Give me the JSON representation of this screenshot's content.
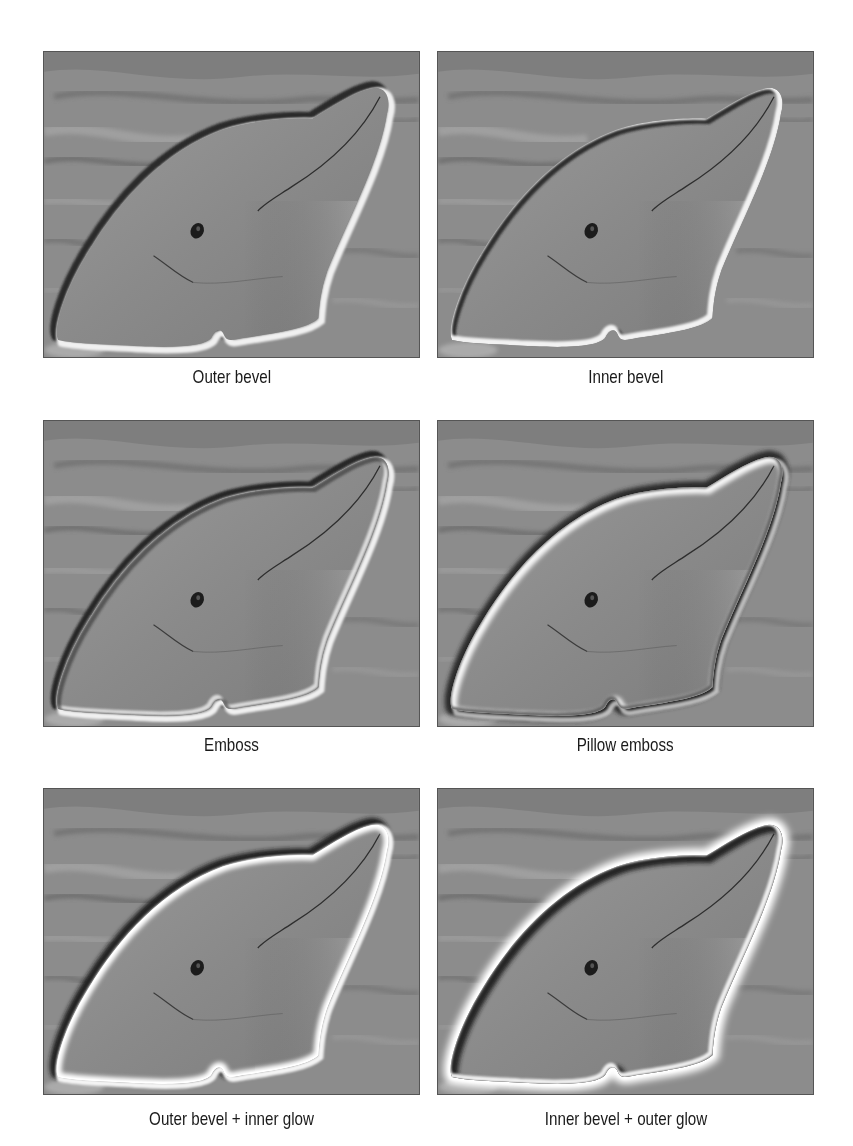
{
  "figure": {
    "panels": [
      {
        "id": "outer-bevel",
        "caption": "Outer bevel",
        "effect": "outer-bevel"
      },
      {
        "id": "inner-bevel",
        "caption": "Inner bevel",
        "effect": "inner-bevel"
      },
      {
        "id": "emboss",
        "caption": "Emboss",
        "effect": "emboss"
      },
      {
        "id": "pillow-emboss",
        "caption": "Pillow emboss",
        "effect": "pillow-emboss"
      },
      {
        "id": "outer-bevel-inner-glow",
        "caption": "Outer bevel + inner glow",
        "effect": "outer-bevel+inner-glow"
      },
      {
        "id": "inner-bevel-outer-glow",
        "caption": "Inner bevel + outer glow",
        "effect": "inner-bevel+outer-glow"
      }
    ],
    "colors": {
      "water": "#8c8c8c",
      "water_dark": "#5e5e5e",
      "water_light": "#adadad",
      "dolphin": "#8f8f8f",
      "highlight": "#f4f4f4",
      "shadow": "#2a2a2a"
    }
  }
}
